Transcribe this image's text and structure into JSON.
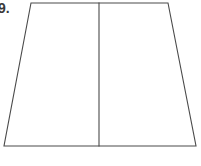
{
  "figure": {
    "label": "9.",
    "label_note": "problem number, partially clipped at left edge",
    "background_color": "#ffffff",
    "stroke_color": "#4a4a4a",
    "fill_color": "#ffffff",
    "stroke_width": 1.1,
    "canvas": {
      "width": 201,
      "height": 166
    },
    "shape": {
      "type": "trapezoid",
      "name": "trapezoid",
      "vertices": [
        {
          "name": "top-left",
          "x": 31,
          "y": 3
        },
        {
          "name": "top-right",
          "x": 168,
          "y": 3
        },
        {
          "name": "bottom-right",
          "x": 196,
          "y": 146
        },
        {
          "name": "bottom-left",
          "x": 4,
          "y": 146
        }
      ],
      "path": "M 31 3 L 168 3 L 196 146 L 4 146 Z"
    },
    "divider": {
      "type": "line-segment",
      "name": "vertical-divider",
      "x1": 99,
      "y1": 3,
      "x2": 99,
      "y2": 146,
      "path": "M 99 3 L 99 146"
    },
    "regions": [
      {
        "name": "left-region",
        "path": "M 31 3 L 99 3 L 99 146 L 4 146 Z"
      },
      {
        "name": "right-region",
        "path": "M 99 3 L 168 3 L 196 146 L 99 146 Z"
      }
    ]
  }
}
